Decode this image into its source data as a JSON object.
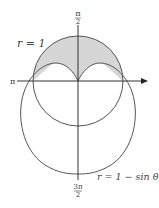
{
  "diagram": {
    "labels": {
      "top_num": "π",
      "top_den": "2",
      "left": "π",
      "bottom_num": "3π",
      "bottom_den": "2",
      "circle": "r = 1",
      "cardioid": "r = 1 − sin θ"
    },
    "colors": {
      "stroke": "#555555",
      "shade": "#d6d6d6",
      "axis": "#333333"
    }
  }
}
